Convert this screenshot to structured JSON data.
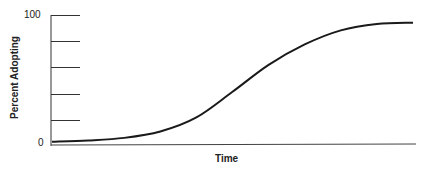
{
  "chart_data": {
    "type": "line",
    "title": "",
    "xlabel": "Time",
    "ylabel": "Percent Adopting",
    "y_tick_labels": [
      "0",
      "100"
    ],
    "y_ticks": [
      0,
      20,
      40,
      60,
      80,
      100
    ],
    "ylim": [
      0,
      100
    ],
    "grid": false,
    "legend": null,
    "series": [
      {
        "name": "Adoption curve (S-curve)",
        "x": [
          0,
          10,
          20,
          30,
          40,
          50,
          60,
          70,
          80,
          90,
          100
        ],
        "values": [
          1,
          2,
          4,
          9,
          20,
          40,
          61,
          77,
          88,
          93,
          94
        ]
      }
    ],
    "colors": {
      "line": "#1a1a1a",
      "axis": "#333333"
    }
  },
  "labels": {
    "y_top": "100",
    "y_bottom": "0",
    "x_axis": "Time",
    "y_axis": "Percent Adopting"
  }
}
